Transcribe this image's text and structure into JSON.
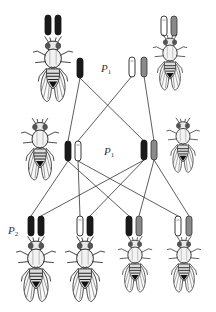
{
  "diagram": {
    "title": "",
    "colors": {
      "background": "#ffffff",
      "black_chromosome": "#1a1a1a",
      "white_chromosome": "#ffffff",
      "gray_chromosome": "#8a8a8a",
      "outline": "#222222",
      "line": "#333333"
    },
    "labels": {
      "p1_top": {
        "main": "P",
        "sub": "1"
      },
      "p1_mid": {
        "main": "P",
        "sub": "1"
      },
      "p2_bottom": {
        "main": "P",
        "sub": "2"
      }
    },
    "generations": [
      {
        "name": "parents",
        "flies": [
          {
            "id": "parent-left",
            "chromosomes": [
              "black",
              "black"
            ]
          },
          {
            "id": "parent-right",
            "chromosomes": [
              "white",
              "gray"
            ]
          }
        ]
      },
      {
        "name": "P1 gametes",
        "chromosomes": [
          "black",
          "white",
          "gray"
        ]
      },
      {
        "name": "P1 offspring",
        "flies": [
          {
            "id": "p1-left",
            "chromosomes": [
              "black",
              "white"
            ]
          },
          {
            "id": "p1-right",
            "chromosomes": [
              "black",
              "gray"
            ]
          }
        ]
      },
      {
        "name": "P2 offspring",
        "flies": [
          {
            "id": "p2-1",
            "chromosomes": [
              "black",
              "black"
            ]
          },
          {
            "id": "p2-2",
            "chromosomes": [
              "white",
              "black"
            ]
          },
          {
            "id": "p2-3",
            "chromosomes": [
              "black",
              "gray"
            ]
          },
          {
            "id": "p2-4",
            "chromosomes": [
              "white",
              "gray"
            ]
          }
        ]
      }
    ]
  }
}
